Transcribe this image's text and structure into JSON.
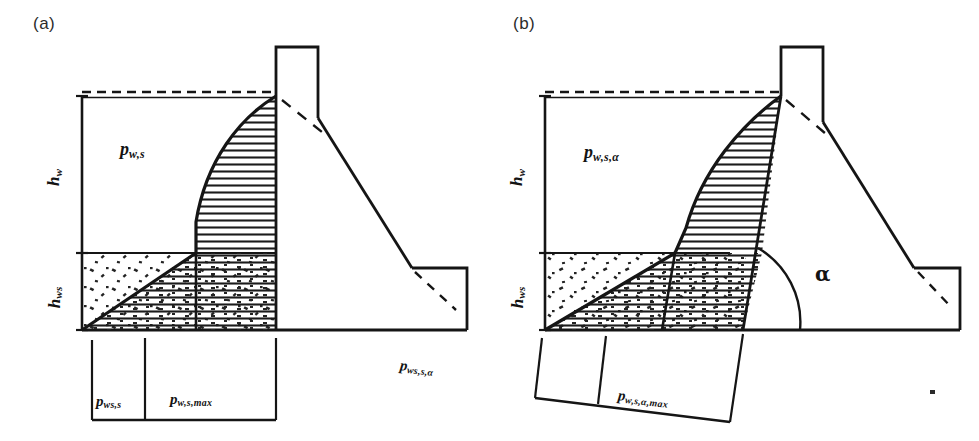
{
  "figure": {
    "background_color": "#ffffff",
    "line_color": "#151515",
    "panel_count": 2
  },
  "panels": [
    {
      "id": "a",
      "caption": "(a)",
      "description": "Vertical upstream wall face; hydrodynamic pressure acting normal to a vertical face",
      "labels": {
        "pressure_upper": {
          "base": "p",
          "sub": "w,s"
        },
        "height_water": {
          "base": "h",
          "sub": "w"
        },
        "height_sediment": {
          "base": "h",
          "sub": "ws"
        },
        "dim_left": {
          "base": "p",
          "sub": "ws,s"
        },
        "dim_right": {
          "base": "p",
          "sub": "w,s,max"
        }
      }
    },
    {
      "id": "b",
      "caption": "(b)",
      "description": "Inclined upstream wall face at angle alpha; hydrodynamic pressure acting normal to the inclined face",
      "labels": {
        "pressure_upper": {
          "base": "p",
          "sub": "w,s,α"
        },
        "height_water": {
          "base": "h",
          "sub": "w"
        },
        "height_sediment": {
          "base": "h",
          "sub": "ws"
        },
        "angle": "α",
        "dim_left": {
          "base": "p",
          "sub": "ws,s,α"
        },
        "dim_right": {
          "base": "p",
          "sub": "w,s,α,max"
        }
      }
    }
  ],
  "geometry": {
    "panel_a": {
      "water_surface_y": 96,
      "sediment_level_y": 253,
      "ground_y": 330,
      "left_edge_x": 82,
      "wall_face_x": 276,
      "stem_right_x": 318,
      "stem_top_y": 47,
      "heel_right_x": 467,
      "heel_top_y": 268,
      "dim_tick_left_x": 92,
      "dim_tick_mid_x": 145,
      "dim_tick_right_x": 276
    },
    "panel_b": {
      "water_surface_y": 96,
      "sediment_level_y": 253,
      "ground_y": 330,
      "left_edge_x": 55,
      "face_top_x": 281,
      "face_bottom_x": 208,
      "stem_top_y": 47,
      "angle_alpha_deg": 72
    }
  },
  "styles": {
    "hatch_spacing_px": 7,
    "hatch_line_color": "#1b1b1b",
    "speckle_color": "#232323",
    "dash_pattern": "9 6"
  }
}
